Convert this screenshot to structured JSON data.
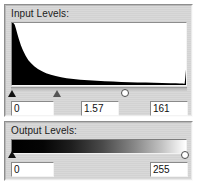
{
  "dialog": {
    "title": "Levels"
  },
  "input_section": {
    "label": "Input Levels:",
    "fields": [
      {
        "name": "shadow",
        "value": "0"
      },
      {
        "name": "gamma",
        "value": "1.57"
      },
      {
        "name": "highlight",
        "value": "161"
      }
    ],
    "handles": [
      {
        "name": "black-point",
        "kind": "triangle-black",
        "position_pct": 0.6
      },
      {
        "name": "midtone-point",
        "kind": "triangle-gray",
        "position_pct": 26.0
      },
      {
        "name": "white-point",
        "kind": "circle-hollow",
        "position_pct": 65.0
      }
    ]
  },
  "output_section": {
    "label": "Output Levels:",
    "fields": [
      {
        "name": "output-black",
        "value": "0"
      },
      {
        "name": "output-white",
        "value": "255"
      }
    ],
    "handles": [
      {
        "name": "output-black-point",
        "kind": "triangle-black",
        "position_pct": 0.6
      },
      {
        "name": "output-white-point",
        "kind": "circle-hollow",
        "position_pct": 99.0
      }
    ],
    "gradient_from": "#000000",
    "gradient_to": "#ffffff"
  },
  "colors": {
    "panel_background": "#d6d6d6",
    "histogram_fill": "#000000",
    "histogram_background": "#ffffff",
    "field_background": "#ffffff",
    "text": "#1b1b1b"
  },
  "chart_data": {
    "type": "area",
    "title": "Input Levels:",
    "xlabel": "",
    "ylabel": "",
    "xlim": [
      0,
      255
    ],
    "ylim": [
      0,
      1
    ],
    "grid": false,
    "legend": null,
    "x": [
      0,
      2,
      4,
      6,
      8,
      10,
      13,
      16,
      20,
      24,
      28,
      33,
      38,
      44,
      50,
      57,
      64,
      72,
      80,
      90,
      100,
      112,
      124,
      136,
      148,
      160,
      172,
      184,
      196,
      208,
      220,
      232,
      240,
      246,
      250,
      252,
      253,
      254,
      255
    ],
    "values": [
      1.0,
      1.0,
      0.97,
      0.9,
      0.82,
      0.74,
      0.64,
      0.56,
      0.47,
      0.4,
      0.35,
      0.3,
      0.26,
      0.22,
      0.19,
      0.165,
      0.145,
      0.125,
      0.11,
      0.095,
      0.085,
      0.075,
      0.067,
      0.06,
      0.055,
      0.05,
      0.046,
      0.042,
      0.039,
      0.036,
      0.033,
      0.03,
      0.028,
      0.026,
      0.024,
      0.022,
      0.02,
      0.12,
      0.25
    ]
  }
}
